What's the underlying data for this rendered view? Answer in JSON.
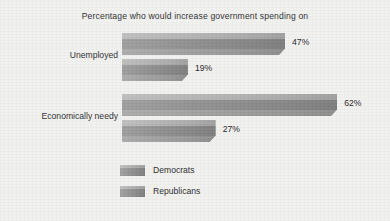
{
  "chart_data": {
    "type": "bar",
    "orientation": "horizontal",
    "title": "Percentage who would increase government spending on",
    "xlabel": "",
    "ylabel": "",
    "categories": [
      "Unemployed",
      "Economically needy"
    ],
    "series": [
      {
        "name": "Democrats",
        "values": [
          47,
          62
        ],
        "value_labels": [
          "47%",
          "62%"
        ],
        "color": "#9a9a9a"
      },
      {
        "name": "Republicans",
        "values": [
          19,
          27
        ],
        "value_labels": [
          "19%",
          "27%"
        ],
        "color": "#9a9a9a"
      }
    ],
    "xlim": [
      0,
      70
    ],
    "grid": false,
    "legend_position": "bottom-left",
    "value_label_suffix": "%"
  },
  "legend": {
    "items": [
      {
        "label": "Democrats"
      },
      {
        "label": "Republicans"
      }
    ]
  },
  "style": {
    "background": "#f1f1f0",
    "text_color": "#2f2f2f",
    "bar_light": "#b4b4b4",
    "bar_mid": "#8d8d8d",
    "bar_dark": "#8a8a8a"
  }
}
